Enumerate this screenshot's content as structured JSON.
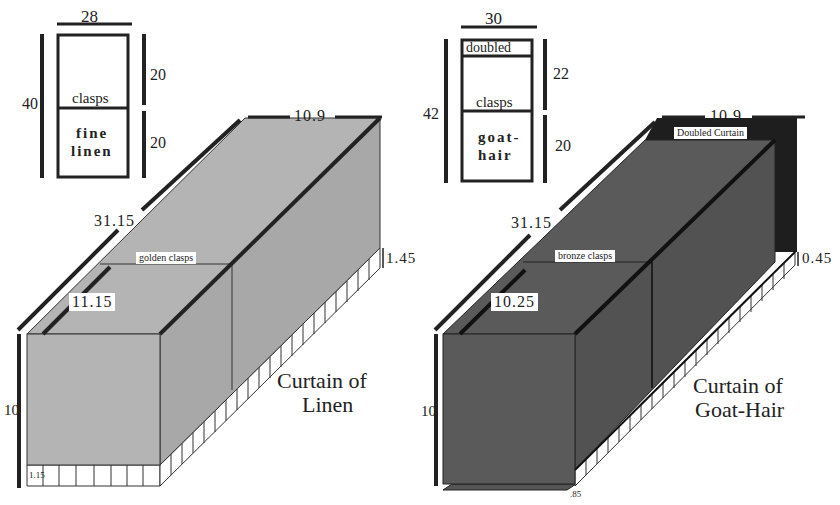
{
  "linen": {
    "plan": {
      "width": "28",
      "total_height": "40",
      "upper_height": "20",
      "lower_height": "20",
      "divider_label": "clasps",
      "material_line1": "fine",
      "material_line2": "linen"
    },
    "box": {
      "length": "31.15",
      "top_width": "10.9",
      "front_depth": "11.15",
      "height": "10",
      "back_overhang": "1.45",
      "bottom_overhang": "1.15",
      "clasps_label": "golden clasps",
      "fill": "#b4b4b4"
    },
    "caption_line1": "Curtain of",
    "caption_line2": "Linen"
  },
  "goathair": {
    "plan": {
      "width": "30",
      "total_height": "42",
      "upper_height": "22",
      "lower_height": "20",
      "top_label": "doubled",
      "divider_label": "clasps",
      "material_line1": "goat-",
      "material_line2": "hair"
    },
    "box": {
      "length": "31.15",
      "top_width": "10.9",
      "front_depth": "10.25",
      "height": "10",
      "back_overhang": "0.45",
      "bottom_overhang": ".85",
      "clasps_label": "bronze clasps",
      "doubled_label": "Doubled Curtain",
      "fill": "#5a5a5a",
      "doubled_fill": "#1e1e1e"
    },
    "caption_line1": "Curtain of",
    "caption_line2": "Goat-Hair"
  }
}
